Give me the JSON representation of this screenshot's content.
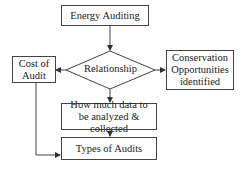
{
  "diagram": {
    "nodes": {
      "energy_auditing": "Energy Auditing",
      "relationship": "Relationship",
      "cost_of_audit": "Cost of Audit",
      "conservation": "Conservation Opportunities identified",
      "how_much_data": "How much data to be analyzed & collected",
      "types_of_audits": "Types of Audits"
    },
    "edges": [
      {
        "from": "Energy Auditing",
        "to": "Relationship"
      },
      {
        "from": "Relationship",
        "to": "Cost of Audit"
      },
      {
        "from": "Relationship",
        "to": "Conservation Opportunities identified"
      },
      {
        "from": "Relationship",
        "to": "How much data to be analyzed & collected"
      },
      {
        "from": "How much data to be analyzed & collected",
        "to": "Types of Audits"
      },
      {
        "from": "Cost of Audit",
        "to": "Types of Audits"
      }
    ],
    "colors": {
      "line": "#444444",
      "background": "#ffffff"
    }
  }
}
